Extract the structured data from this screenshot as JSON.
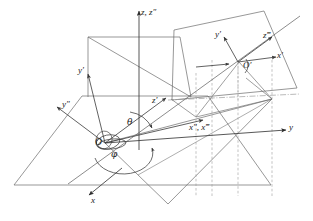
{
  "figure": {
    "background_color": "#ffffff",
    "line_color": "#4d4d4d",
    "axis_color": "#3a3a3a",
    "dash_color": "#8c8c8c",
    "label_color": "#1a1a1a",
    "width": 313,
    "height": 221
  },
  "labels": {
    "z_axis": "z, z″",
    "y_axis": "y",
    "x_axis": "x",
    "y_prime_left": "y′",
    "y_double_prime": "y″",
    "z_prime_center": "z′",
    "x_double_triple_prime": "x″, x‴",
    "origin": "O",
    "theta": "θ",
    "phi": "φ",
    "y_prime_right": "y′",
    "z_prime_right": "z‴",
    "x_prime_right": "x′",
    "origin_prime": "O′"
  },
  "geometry": {
    "origin": {
      "x": 105,
      "y": 143
    },
    "z_axis_tip": {
      "x": 139,
      "y": 11
    },
    "y_axis_tip": {
      "x": 288,
      "y": 130
    },
    "x_axis_tip": {
      "x": 88,
      "y": 196
    },
    "second_origin": {
      "x": 238,
      "y": 62
    },
    "horizontal_plane": "14,185 82,96 208,96 271,185",
    "vertical_plane": "88,37 180,37 191,97 88,97",
    "tilted_plane": "171,99 173,30 263,11 297,88",
    "angles": {
      "theta_label_pos": {
        "x": 127,
        "y": 122
      },
      "phi_label_pos": {
        "x": 111,
        "y": 152
      }
    }
  },
  "annotations": {
    "dashed_vertical_count": 4,
    "dashdot_horizontal": true
  }
}
